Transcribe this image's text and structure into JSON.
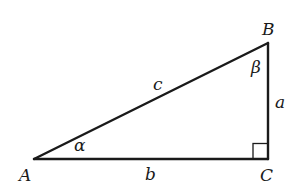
{
  "diagram": {
    "type": "right-triangle",
    "colors": {
      "stroke": "#1a1a1a",
      "background": "#ffffff"
    },
    "vertices": {
      "A": {
        "label": "A",
        "x": 34,
        "y": 159
      },
      "B": {
        "label": "B",
        "x": 268,
        "y": 43
      },
      "C": {
        "label": "C",
        "x": 268,
        "y": 159
      }
    },
    "sides": {
      "a": {
        "label": "a",
        "between": "B-C"
      },
      "b": {
        "label": "b",
        "between": "A-C"
      },
      "c": {
        "label": "c",
        "between": "A-B"
      }
    },
    "angles": {
      "alpha": {
        "label": "α",
        "at": "A"
      },
      "beta": {
        "label": "β",
        "at": "B"
      },
      "right_angle": {
        "at": "C",
        "marker": "square"
      }
    }
  }
}
